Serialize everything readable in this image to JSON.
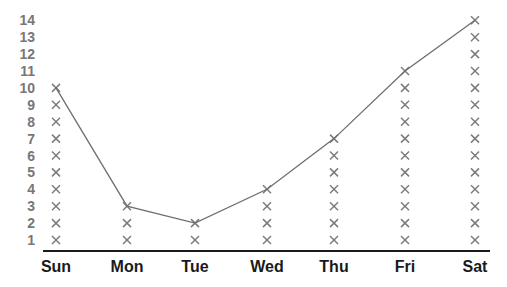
{
  "chart_data": {
    "type": "line",
    "subtype": "line plot with stacked x markers (pictograph)",
    "title": "",
    "xlabel": "",
    "ylabel": "",
    "categories": [
      "Sun",
      "Mon",
      "Tue",
      "Wed",
      "Thu",
      "Fri",
      "Sat"
    ],
    "values": [
      10,
      3,
      2,
      4,
      7,
      11,
      14
    ],
    "y_ticks": [
      1,
      2,
      3,
      4,
      5,
      6,
      7,
      8,
      9,
      10,
      11,
      12,
      13,
      14
    ],
    "ylim": [
      1,
      14
    ],
    "marker": "x",
    "grid": false,
    "legend": null,
    "colors": {
      "marker": "#7a7a7a",
      "line": "#6e6e6e",
      "axis": "#1a1a1a",
      "ytick": "#777777",
      "xtick": "#1a1a1a"
    }
  }
}
